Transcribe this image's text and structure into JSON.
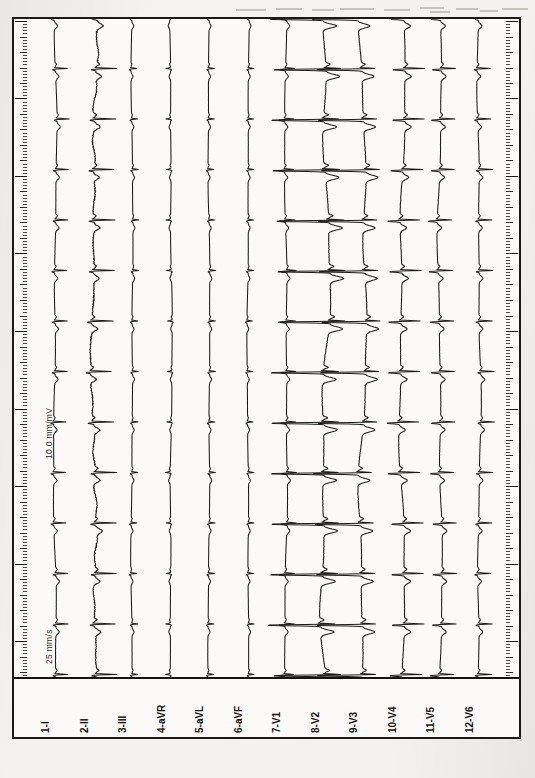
{
  "document": {
    "kind": "ecg-strip-chart",
    "orientation": "rotated-90-ccw",
    "paper_color": "#fbfaf8",
    "ink_color": "#141414",
    "background_color": "#f3f2f0"
  },
  "calibration": {
    "speed_label": "25 mm/s",
    "gain_label": "10.0 mm/mV",
    "speed_mm_per_s": 25,
    "gain_mm_per_mV": 10
  },
  "ruler": {
    "present": true,
    "sides": [
      "left",
      "right"
    ],
    "minor_tick_spacing_px": 3.1,
    "major_tick_every": 5,
    "long_tick_every": 25
  },
  "leads": [
    {
      "index": 1,
      "number": "1",
      "name": "I",
      "label": "1-I",
      "x": 20,
      "amplitude": 0.5,
      "morphology": "normal"
    },
    {
      "index": 2,
      "number": "2",
      "name": "II",
      "label": "2-II",
      "x": 59,
      "amplitude": 0.85,
      "morphology": "noisy"
    },
    {
      "index": 3,
      "number": "3",
      "name": "III",
      "label": "3-III",
      "x": 97,
      "amplitude": 0.3,
      "morphology": "low"
    },
    {
      "index": 4,
      "number": "4",
      "name": "aVR",
      "label": "4-aVR",
      "x": 136,
      "amplitude": 0.35,
      "morphology": "inverted"
    },
    {
      "index": 5,
      "number": "5",
      "name": "aVL",
      "label": "5-aVL",
      "x": 174,
      "amplitude": 0.3,
      "morphology": "low"
    },
    {
      "index": 6,
      "number": "6",
      "name": "aVF",
      "label": "6-aVF",
      "x": 213,
      "amplitude": 0.28,
      "morphology": "low"
    },
    {
      "index": 7,
      "number": "7",
      "name": "V1",
      "label": "7-V1",
      "x": 251,
      "amplitude": 0.45,
      "morphology": "rs"
    },
    {
      "index": 8,
      "number": "8",
      "name": "V2",
      "label": "8-V2",
      "x": 290,
      "amplitude": 1.55,
      "morphology": "deep-s"
    },
    {
      "index": 9,
      "number": "9",
      "name": "V3",
      "label": "9-V3",
      "x": 328,
      "amplitude": 1.35,
      "morphology": "deep-s"
    },
    {
      "index": 10,
      "number": "10",
      "name": "V4",
      "label": "10-V4",
      "x": 367,
      "amplitude": 0.95,
      "morphology": "rs"
    },
    {
      "index": 11,
      "number": "11",
      "name": "V5",
      "label": "11-V5",
      "x": 405,
      "amplitude": 0.7,
      "morphology": "rs"
    },
    {
      "index": 12,
      "number": "12",
      "name": "V6",
      "label": "12-V6",
      "x": 444,
      "amplitude": 0.55,
      "morphology": "normal"
    }
  ],
  "chart_data": {
    "type": "line",
    "title": "",
    "xlabel": "",
    "ylabel": "",
    "grid": false,
    "legend": "none",
    "orientation": "vertical-time-axis",
    "time_axis": {
      "direction": "top-to-bottom",
      "duration_s": 10.0,
      "range_px": [
        0,
        660
      ]
    },
    "beats": {
      "count": 13,
      "rr_interval_px": 50.5,
      "first_beat_px": 40,
      "heart_rate_bpm": 74
    },
    "series": [
      {
        "name": "I",
        "baseline_px": 20,
        "scale": 0.5
      },
      {
        "name": "II",
        "baseline_px": 59,
        "scale": 0.85
      },
      {
        "name": "III",
        "baseline_px": 97,
        "scale": 0.3
      },
      {
        "name": "aVR",
        "baseline_px": 136,
        "scale": 0.35
      },
      {
        "name": "aVL",
        "baseline_px": 174,
        "scale": 0.3
      },
      {
        "name": "aVF",
        "baseline_px": 213,
        "scale": 0.28
      },
      {
        "name": "V1",
        "baseline_px": 251,
        "scale": 0.45
      },
      {
        "name": "V2",
        "baseline_px": 290,
        "scale": 1.55
      },
      {
        "name": "V3",
        "baseline_px": 328,
        "scale": 1.35
      },
      {
        "name": "V4",
        "baseline_px": 367,
        "scale": 0.95
      },
      {
        "name": "V5",
        "baseline_px": 405,
        "scale": 0.7
      },
      {
        "name": "V6",
        "baseline_px": 444,
        "scale": 0.55
      }
    ]
  },
  "artifacts": [
    {
      "x": 236,
      "y": 9,
      "w": 30
    },
    {
      "x": 276,
      "y": 8,
      "w": 26
    },
    {
      "x": 312,
      "y": 9,
      "w": 22
    },
    {
      "x": 340,
      "y": 8,
      "w": 34
    },
    {
      "x": 384,
      "y": 9,
      "w": 26
    },
    {
      "x": 420,
      "y": 7,
      "w": 24
    },
    {
      "x": 430,
      "y": 11,
      "w": 20
    },
    {
      "x": 456,
      "y": 8,
      "w": 22
    },
    {
      "x": 480,
      "y": 10,
      "w": 18
    },
    {
      "x": 502,
      "y": 8,
      "w": 26
    }
  ]
}
